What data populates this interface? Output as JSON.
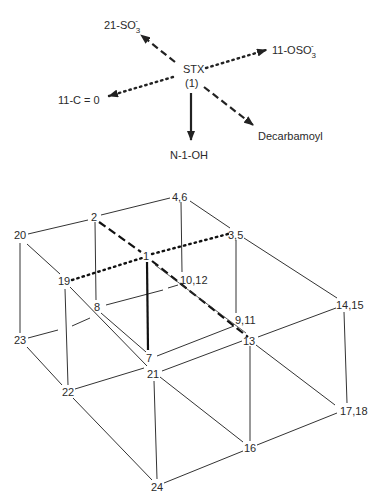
{
  "pathway_diagram": {
    "center": {
      "label": "STX",
      "sublabel": "(1)"
    },
    "arrows": [
      {
        "id": "sulfo-21",
        "label": "21-SO",
        "sub": "3",
        "sup": "-",
        "style": "dashed"
      },
      {
        "id": "osulfo-11",
        "label": "11-OSO",
        "sub": "3",
        "sup": "-",
        "style": "dotted"
      },
      {
        "id": "keto-11",
        "label": "11-C = 0",
        "style": "dotted"
      },
      {
        "id": "decarbamoyl",
        "label": "Decarbamoyl",
        "style": "dashed"
      },
      {
        "id": "n1-hydroxy",
        "label": "N-1-OH",
        "style": "solid-bold"
      }
    ]
  },
  "lattice": {
    "nodes": [
      {
        "id": "n4_6",
        "label": "4,6"
      },
      {
        "id": "n2",
        "label": "2"
      },
      {
        "id": "n20",
        "label": "20"
      },
      {
        "id": "n3_5",
        "label": "3,5"
      },
      {
        "id": "n1",
        "label": "1"
      },
      {
        "id": "n19",
        "label": "19"
      },
      {
        "id": "n10_12",
        "label": "10,12"
      },
      {
        "id": "n8",
        "label": "8"
      },
      {
        "id": "n14_15",
        "label": "14,15"
      },
      {
        "id": "n9_11",
        "label": "9,11"
      },
      {
        "id": "n23",
        "label": "23"
      },
      {
        "id": "n13",
        "label": "13"
      },
      {
        "id": "n7",
        "label": "7"
      },
      {
        "id": "n21",
        "label": "21"
      },
      {
        "id": "n22",
        "label": "22"
      },
      {
        "id": "n17_18",
        "label": "17,18"
      },
      {
        "id": "n16",
        "label": "16"
      },
      {
        "id": "n24",
        "label": "24"
      }
    ],
    "highlighted_edges": [
      {
        "from": "2",
        "to": "1",
        "style": "dashed"
      },
      {
        "from": "1",
        "to": "9,11",
        "style": "dashed"
      },
      {
        "from": "19",
        "to": "1",
        "style": "dotted"
      },
      {
        "from": "1",
        "to": "3,5",
        "style": "dotted"
      },
      {
        "from": "1",
        "to": "7",
        "style": "solid-bold"
      }
    ]
  },
  "colors": {
    "ink": "#2a2a2a",
    "background": "#ffffff"
  }
}
